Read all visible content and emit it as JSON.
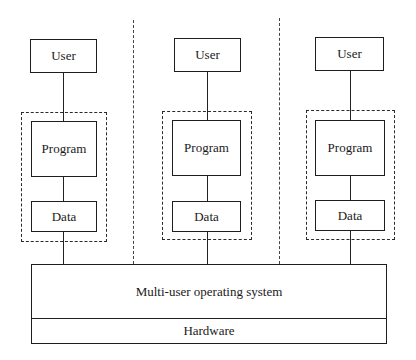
{
  "diagram": {
    "type": "architecture",
    "columns": [
      {
        "user": "User",
        "program": "Program",
        "data": "Data"
      },
      {
        "user": "User",
        "program": "Program",
        "data": "Data"
      },
      {
        "user": "User",
        "program": "Program",
        "data": "Data"
      }
    ],
    "os_label": "Multi-user operating system",
    "hardware_label": "Hardware"
  }
}
